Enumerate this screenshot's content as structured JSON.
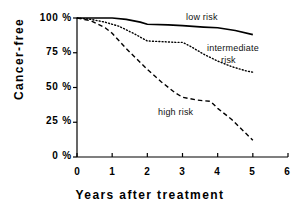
{
  "chart_data": {
    "type": "line",
    "title": "",
    "subtitle": "",
    "xlabel": "Years after treatment",
    "ylabel": "Cancer-free",
    "xlim": [
      0,
      6
    ],
    "ylim": [
      0,
      100
    ],
    "xticks": [
      "0",
      "1",
      "2",
      "3",
      "4",
      "5",
      "6"
    ],
    "xtick_values": [
      0,
      1,
      2,
      3,
      4,
      5,
      6
    ],
    "yticks": [
      "0 %",
      "25 %",
      "50 %",
      "75 %",
      "100 %"
    ],
    "ytick_values": [
      0,
      25,
      50,
      75,
      100
    ],
    "grid": false,
    "legend_position": "inline-annotations",
    "series": [
      {
        "name": "low risk",
        "style": "solid",
        "color": "#000000",
        "x": [
          0,
          0.5,
          1.0,
          1.4,
          1.8,
          2.0,
          2.6,
          3.0,
          3.6,
          4.0,
          4.5,
          5.0
        ],
        "y": [
          100,
          100,
          100,
          99,
          97,
          95.5,
          95,
          94.5,
          93.5,
          93,
          91,
          88
        ]
      },
      {
        "name": "intermediate risk",
        "style": "dotted",
        "color": "#000000",
        "x": [
          0,
          0.4,
          0.8,
          1.2,
          1.6,
          2.0,
          2.4,
          2.8,
          3.0,
          3.2,
          3.6,
          4.0,
          4.4,
          4.8,
          5.0
        ],
        "y": [
          100,
          99,
          97,
          94,
          89,
          83.5,
          83,
          82.5,
          82.5,
          80,
          74,
          69,
          65,
          62,
          61
        ]
      },
      {
        "name": "high risk",
        "style": "dashed",
        "color": "#000000",
        "x": [
          0,
          0.4,
          0.8,
          1.0,
          1.4,
          1.8,
          2.0,
          2.4,
          2.8,
          3.0,
          3.4,
          3.8,
          4.0,
          4.4,
          4.8,
          5.0
        ],
        "y": [
          100,
          98,
          93,
          89,
          78,
          68,
          63,
          54,
          46,
          43,
          41,
          40,
          35,
          27,
          17,
          12
        ]
      }
    ],
    "annotations": [
      {
        "text": "low risk",
        "x": 3.1,
        "y": 95
      },
      {
        "text": "intermediate",
        "x": 3.85,
        "y": 73
      },
      {
        "text": "risk",
        "x": 4.15,
        "y": 64
      },
      {
        "text": "high risk",
        "x": 2.35,
        "y": 30
      }
    ]
  },
  "axes": {
    "ylabel": "Cancer-free",
    "xlabel": "Years after treatment",
    "ytick_labels": [
      "100 %",
      "75 %",
      "50 %",
      "25 %",
      "0 %"
    ],
    "xtick_labels": [
      "0",
      "1",
      "2",
      "3",
      "4",
      "5",
      "6"
    ]
  },
  "labels": {
    "low_risk": "low risk",
    "intermediate": "intermediate",
    "risk": "risk",
    "high_risk": "high risk"
  }
}
